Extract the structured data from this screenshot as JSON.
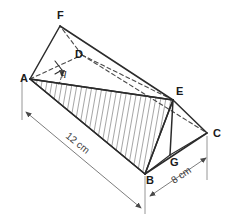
{
  "figure": {
    "type": "geometry-diagram",
    "background_color": "#ffffff",
    "line_color": "#2b2b2b",
    "dimension_color": "#6e6e6e"
  },
  "vertices": [
    {
      "id": "A",
      "label": "A",
      "x": 30,
      "y": 79,
      "label_x": 20,
      "label_y": 82,
      "hidden": false
    },
    {
      "id": "B",
      "label": "B",
      "x": 145,
      "y": 174,
      "label_x": 146,
      "label_y": 184,
      "hidden": false
    },
    {
      "id": "C",
      "label": "C",
      "x": 207,
      "y": 133,
      "label_x": 213,
      "label_y": 137,
      "hidden": false
    },
    {
      "id": "D",
      "label": "D",
      "x": 82,
      "y": 55,
      "label_x": 75,
      "label_y": 58,
      "hidden": true
    },
    {
      "id": "E",
      "label": "E",
      "x": 173,
      "y": 100,
      "label_x": 176,
      "label_y": 95,
      "hidden": false
    },
    {
      "id": "F",
      "label": "F",
      "x": 60,
      "y": 26,
      "label_x": 57,
      "label_y": 19,
      "hidden": false
    },
    {
      "id": "G",
      "label": "G",
      "x": 170,
      "y": 155,
      "label_x": 170,
      "label_y": 166,
      "hidden": false
    }
  ],
  "edges_solid": [
    {
      "from": "A",
      "to": "F"
    },
    {
      "from": "F",
      "to": "E"
    },
    {
      "from": "A",
      "to": "E"
    },
    {
      "from": "A",
      "to": "B"
    },
    {
      "from": "B",
      "to": "C"
    },
    {
      "from": "C",
      "to": "E"
    },
    {
      "from": "B",
      "to": "E"
    },
    {
      "from": "E",
      "to": "G"
    },
    {
      "from": "B",
      "to": "G"
    },
    {
      "from": "G",
      "to": "C"
    }
  ],
  "edges_hidden": [
    {
      "from": "A",
      "to": "D"
    },
    {
      "from": "D",
      "to": "F"
    },
    {
      "from": "D",
      "to": "E"
    },
    {
      "from": "D",
      "to": "C"
    }
  ],
  "shaded_face": {
    "name": "triangle-AEB",
    "vertices": [
      "A",
      "E",
      "B"
    ],
    "fill_style": "diagonal-hatching"
  },
  "angle": {
    "id": "theta-at-A",
    "label": "q",
    "at_vertex": "A",
    "between": [
      "A-E",
      "A-D"
    ],
    "label_x": 61,
    "label_y": 76
  },
  "dimensions": [
    {
      "id": "length-12",
      "label": "12 cm",
      "value": 12,
      "unit": "cm",
      "along": "A-B",
      "label_x": 65,
      "label_y": 137,
      "rotation": 39
    },
    {
      "id": "width-8",
      "label": "8 cm",
      "value": 8,
      "unit": "cm",
      "along": "B-C",
      "label_x": 185,
      "label_y": 178,
      "rotation": -34
    }
  ]
}
